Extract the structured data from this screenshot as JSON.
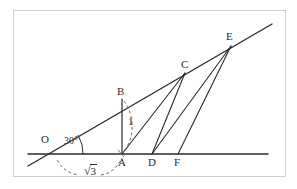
{
  "figure": {
    "background_color": "#ffffff",
    "frame_color": "#cfcfcf",
    "line_color": "#2b2b2b",
    "dashed_color": "#6e6e6e",
    "label_color": "#2b2b2b"
  },
  "labels": {
    "origin": "O",
    "angle": "30°",
    "point_a": "A",
    "point_b": "B",
    "point_c": "C",
    "point_d": "D",
    "point_e": "E",
    "point_f": "F",
    "unit_length": "1",
    "base_length_sign": "√",
    "base_length_value": "3"
  },
  "geometry": {
    "ray_start": [
      28,
      166
    ],
    "ray_end": [
      272,
      24
    ],
    "baseline_start": [
      28,
      154
    ],
    "baseline_end": [
      268,
      154
    ],
    "points": {
      "O": [
        47,
        155
      ],
      "A": [
        122,
        154
      ],
      "B": [
        122,
        99
      ],
      "C": [
        185,
        73
      ],
      "D": [
        152,
        154
      ],
      "E": [
        231,
        46
      ],
      "F": [
        178,
        154
      ]
    },
    "segments": [
      [
        "A",
        "B"
      ],
      [
        "A",
        "C"
      ],
      [
        "D",
        "C"
      ],
      [
        "D",
        "E"
      ],
      [
        "F",
        "E"
      ]
    ],
    "angle_arc_degrees": 30,
    "unit_label_segment": [
      "A",
      "B"
    ],
    "base_label_segment": [
      "O",
      "A"
    ]
  }
}
